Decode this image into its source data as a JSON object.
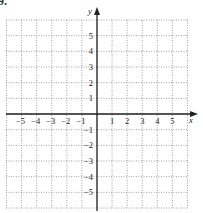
{
  "problem_label": "9.",
  "chart_data": {
    "type": "scatter",
    "title": "",
    "xlabel": "x",
    "ylabel": "y",
    "xlim": [
      -6,
      6
    ],
    "ylim": [
      -6,
      6
    ],
    "grid": true,
    "grid_style": "dotted",
    "x_ticks": [
      -5,
      -4,
      -3,
      -2,
      -1,
      1,
      2,
      3,
      4,
      5
    ],
    "y_ticks": [
      -5,
      -4,
      -3,
      -2,
      -1,
      1,
      2,
      3,
      4,
      5
    ],
    "x_tick_labels": [
      "−5",
      "−4",
      "−3",
      "−2",
      "−1",
      "1",
      "2",
      "3",
      "4",
      "5"
    ],
    "y_tick_labels": [
      "−5",
      "−4",
      "−3",
      "−2",
      "−1",
      "1",
      "2",
      "3",
      "4",
      "5"
    ],
    "points": [],
    "series": []
  },
  "colors": {
    "grid": "#8a8a8a",
    "axis": "#222222",
    "text": "#222222"
  }
}
